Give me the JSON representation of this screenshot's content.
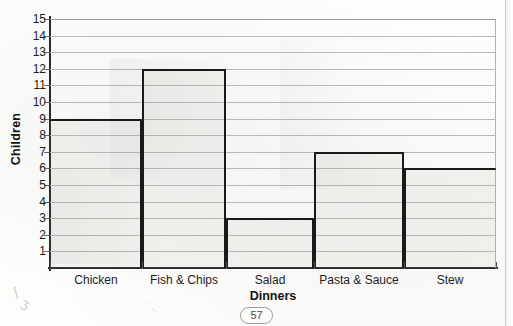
{
  "page": {
    "number": "57",
    "background_color": "#fdfdfc",
    "ink_color": "#1a1a1a",
    "grid_color": "#b9b9b9"
  },
  "chart_data": {
    "type": "bar",
    "title": "",
    "categories": [
      "Chicken",
      "Fish & Chips",
      "Salad",
      "Pasta & Sauce",
      "Stew"
    ],
    "values": [
      9,
      12,
      3,
      7,
      6
    ],
    "xlabel": "Dinners",
    "ylabel": "Children",
    "ylim": [
      0,
      15
    ],
    "ytick_labels": [
      "15",
      "14",
      "13",
      "12",
      "11",
      "10",
      "9",
      "8",
      "7",
      "6",
      "5",
      "4",
      "3",
      "2",
      "1"
    ],
    "ytick_values": [
      15,
      14,
      13,
      12,
      11,
      10,
      9,
      8,
      7,
      6,
      5,
      4,
      3,
      2,
      1
    ],
    "grid": true,
    "grid_axis": "y",
    "legend": false,
    "legend_position": "none",
    "style": "hand-drawn-on-scanned-worksheet"
  }
}
